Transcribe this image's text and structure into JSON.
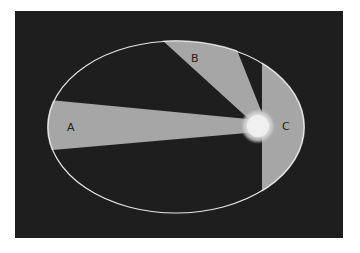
{
  "diagram": {
    "title": "",
    "colors": {
      "background": "#1e1e1e",
      "sector_fill": "#a6a6a6",
      "orbit_stroke": "#e6e6e6",
      "sun_core": "#f2f2f2",
      "label_color": "#222222"
    },
    "orbit": {
      "shape": "ellipse"
    },
    "sun": {
      "label": ""
    },
    "sectors": [
      {
        "id": "A",
        "label": "A"
      },
      {
        "id": "B",
        "label": "B"
      },
      {
        "id": "C",
        "label": "C"
      }
    ]
  }
}
